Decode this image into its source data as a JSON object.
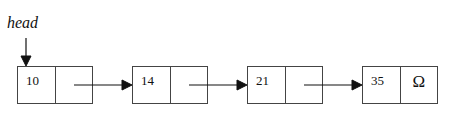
{
  "head_label": "head",
  "nodes": [
    {
      "value": "10",
      "next": ""
    },
    {
      "value": "14",
      "next": ""
    },
    {
      "value": "21",
      "next": ""
    },
    {
      "value": "35",
      "next": "Ω"
    }
  ],
  "colors": {
    "stroke": "#111111",
    "box": "#444444"
  }
}
